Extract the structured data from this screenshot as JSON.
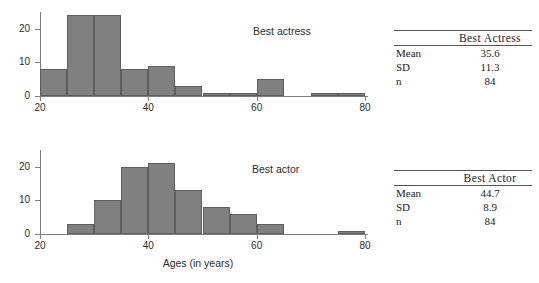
{
  "chart_data": [
    {
      "type": "bar",
      "id": "best-actress",
      "title": "Best actress",
      "xlabel": "",
      "ylabel": "",
      "xlim": [
        20,
        80
      ],
      "ylim": [
        0,
        25
      ],
      "bin_width": 5,
      "grid": false,
      "xticks": [
        20,
        40,
        60,
        80
      ],
      "yticks": [
        0,
        10,
        20
      ],
      "categories": [
        "20-25",
        "25-30",
        "30-35",
        "35-40",
        "40-45",
        "45-50",
        "50-55",
        "55-60",
        "60-65",
        "65-70",
        "70-75",
        "75-80"
      ],
      "bin_starts": [
        20,
        25,
        30,
        35,
        40,
        45,
        50,
        55,
        60,
        65,
        70,
        75
      ],
      "values": [
        8,
        24,
        24,
        8,
        9,
        3,
        1,
        1,
        5,
        0,
        1,
        1
      ]
    },
    {
      "type": "bar",
      "id": "best-actor",
      "title": "Best actor",
      "xlabel": "Ages (in years)",
      "ylabel": "",
      "xlim": [
        20,
        80
      ],
      "ylim": [
        0,
        25
      ],
      "bin_width": 5,
      "grid": false,
      "xticks": [
        20,
        40,
        60,
        80
      ],
      "yticks": [
        0,
        10,
        20
      ],
      "categories": [
        "20-25",
        "25-30",
        "30-35",
        "35-40",
        "40-45",
        "45-50",
        "50-55",
        "55-60",
        "60-65",
        "65-70",
        "70-75",
        "75-80"
      ],
      "bin_starts": [
        20,
        25,
        30,
        35,
        40,
        45,
        50,
        55,
        60,
        65,
        70,
        75
      ],
      "values": [
        0,
        3,
        10,
        20,
        21,
        13,
        8,
        6,
        3,
        0,
        0,
        1
      ]
    }
  ],
  "charts": {
    "actress": {
      "series_label": "Best actress",
      "ytick_labels": [
        "0",
        "10",
        "20"
      ],
      "xtick_labels": [
        "20",
        "40",
        "60",
        "80"
      ]
    },
    "actor": {
      "series_label": "Best actor",
      "ytick_labels": [
        "0",
        "10",
        "20"
      ],
      "xtick_labels": [
        "20",
        "40",
        "60",
        "80"
      ],
      "xaxis_title": "Ages (in years)"
    }
  },
  "tables": [
    {
      "id": "best-actress-stats",
      "corner_label": "",
      "header": "Best Actress",
      "rows": [
        {
          "label": "Mean",
          "value": "35.6"
        },
        {
          "label": "SD",
          "value": "11.3"
        },
        {
          "label": "n",
          "value": "84"
        }
      ]
    },
    {
      "id": "best-actor-stats",
      "corner_label": "",
      "header": "Best Actor",
      "rows": [
        {
          "label": "Mean",
          "value": "44.7"
        },
        {
          "label": "SD",
          "value": "8.9"
        },
        {
          "label": "n",
          "value": "84"
        }
      ]
    }
  ],
  "colors": {
    "bar_fill": "#808080",
    "bar_stroke": "#5e5e5e",
    "axis": "#7d7d7d",
    "text": "#1a1a1a",
    "background": "#ffffff"
  }
}
